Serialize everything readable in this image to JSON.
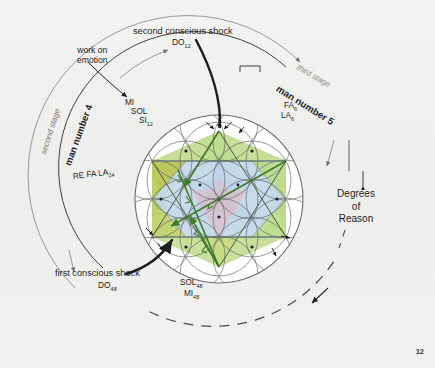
{
  "page": {
    "number": "12"
  },
  "diagram": {
    "title_labels": {
      "second_shock": "second conscious shock",
      "second_shock_note": "DO",
      "second_shock_note_sub": "12",
      "first_shock": "first conscious shock",
      "first_shock_note": "DO",
      "first_shock_note_sub": "48",
      "work_on_emotion_l1": "work on",
      "work_on_emotion_l2": "emotion"
    },
    "arc_labels": {
      "second_stage": "second stage",
      "third_stage": "third stage",
      "man_number_4": "man number 4",
      "man_number_5": "man number 5",
      "degrees_l1": "Degrees",
      "degrees_l2": "of",
      "degrees_l3": "Reason"
    },
    "note_groups": {
      "left_upper": [
        {
          "name": "MI",
          "sub": ""
        },
        {
          "name": "SOL",
          "sub": ""
        },
        {
          "name": "SI",
          "sub": "12"
        }
      ],
      "left_mid": "RE FA LA",
      "left_mid_sub": "24",
      "right_upper": [
        {
          "name": "FA",
          "sub": "6"
        },
        {
          "name": "LA",
          "sub": "6"
        }
      ],
      "bottom": [
        {
          "name": "SOL",
          "sub": "48"
        },
        {
          "name": "MI",
          "sub": "48"
        }
      ]
    },
    "colors": {
      "green_light": "#b9d98a",
      "green_olive": "#b7c455",
      "blue_light": "#bdd4ea",
      "pink_center": "#d9c2cf",
      "green_arrow": "#3f7a29",
      "ink": "#1d1d1b",
      "gray_arc": "#8d8d8a",
      "circle_line": "#6b6b68",
      "background": "#f2f2f0"
    },
    "geometry": {
      "center_x": 219,
      "center_y": 199,
      "main_radius": 84,
      "hexagram_radius": 78,
      "petal_radius": 39
    }
  }
}
